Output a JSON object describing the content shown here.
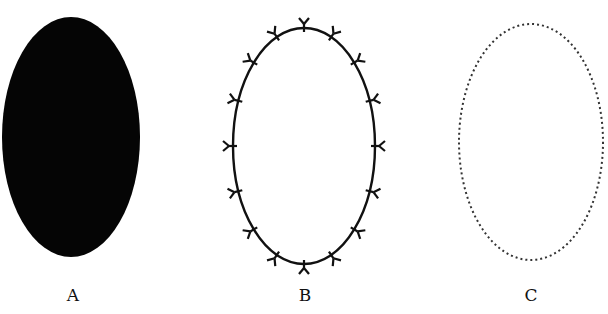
{
  "figures": [
    {
      "id": "A",
      "label": "A",
      "style": "filled",
      "cx": 71,
      "cy": 137,
      "rx": 69,
      "ry": 120,
      "fill": "#050505"
    },
    {
      "id": "B",
      "label": "B",
      "style": "solid-outline-with-markers",
      "cx": 304,
      "cy": 146,
      "rx": 71,
      "ry": 118,
      "stroke": "#111111",
      "marker_count": 16
    },
    {
      "id": "C",
      "label": "C",
      "style": "dotted-outline",
      "cx": 531,
      "cy": 142,
      "rx": 72,
      "ry": 118,
      "stroke": "#333333"
    }
  ],
  "labels": {
    "a": "A",
    "b": "B",
    "c": "C"
  }
}
